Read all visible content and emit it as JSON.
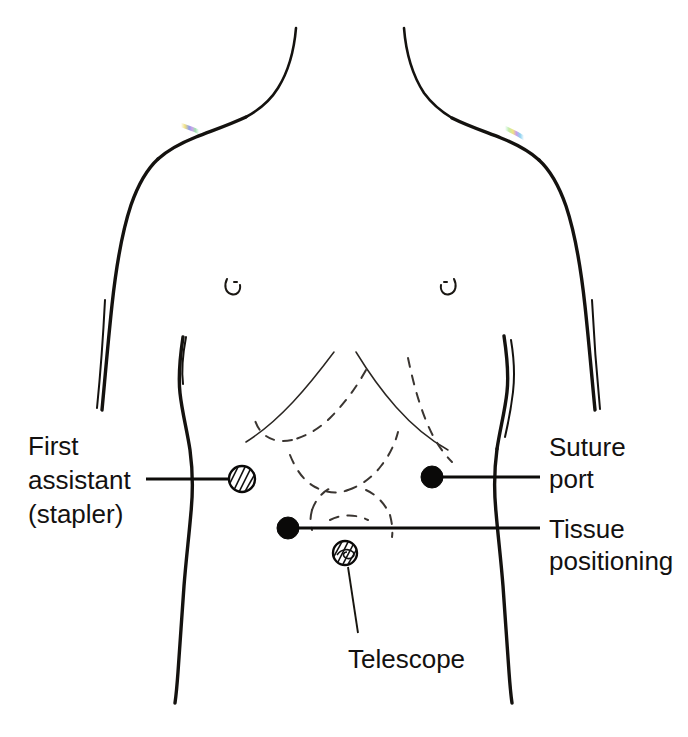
{
  "figure": {
    "background_color": "#ffffff",
    "line_color": "#14120f",
    "width": 688,
    "height": 737
  },
  "labels": {
    "first_assistant": {
      "lines": [
        "First",
        "assistant",
        "(stapler)"
      ],
      "line1": "First",
      "line2": "assistant",
      "line3": "(stapler)",
      "side": "left",
      "marker": "hatched-circle"
    },
    "suture_port": {
      "lines": [
        "Suture",
        "port"
      ],
      "line1": "Suture",
      "line2": "port",
      "side": "right",
      "marker": "solid-dot"
    },
    "tissue_positioning": {
      "lines": [
        "Tissue",
        "positioning"
      ],
      "line1": "Tissue",
      "line2": "positioning",
      "side": "right",
      "marker": "solid-dot"
    },
    "telescope": {
      "lines": [
        "Telescope"
      ],
      "line1": "Telescope",
      "side": "bottom",
      "marker": "hatched-circle-umbilicus"
    }
  },
  "ports": [
    {
      "name": "first-assistant-stapler",
      "x": 242,
      "y": 479,
      "radius": 14,
      "style": "hatched"
    },
    {
      "name": "suture-port",
      "x": 432,
      "y": 477,
      "radius": 11,
      "style": "solid"
    },
    {
      "name": "tissue-positioning",
      "x": 288,
      "y": 528,
      "radius": 11,
      "style": "solid"
    },
    {
      "name": "telescope-umbilicus",
      "x": 345,
      "y": 553,
      "radius": 13,
      "style": "hatched"
    }
  ],
  "anatomy": {
    "nipple_left": {
      "x": 233,
      "y": 285
    },
    "nipple_right": {
      "x": 448,
      "y": 285
    },
    "costal_margin": "dashed rib margin and bowel outlines",
    "shoulder_fringe_color_left": "#8a7bd8",
    "shoulder_fringe_color_right": "#7ec8e8"
  }
}
